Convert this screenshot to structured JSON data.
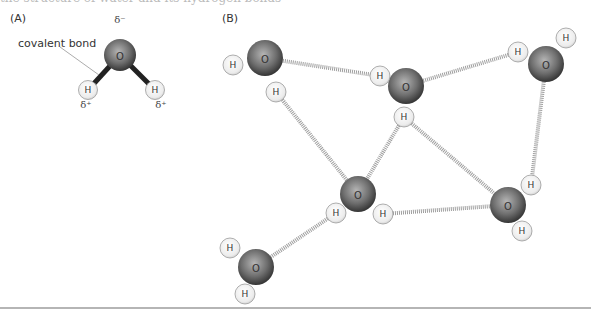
{
  "caption_fragment": "the structure of water and its hydrogen bonds",
  "panel_a": {
    "label": "(A)",
    "oxygen_symbol": "O",
    "hydrogen_symbol": "H",
    "partial_negative": "δ⁻",
    "partial_positive": "δ⁺",
    "bond_label": "covalent bond"
  },
  "panel_b": {
    "label": "(B)",
    "oxygen_symbol": "O",
    "hydrogen_symbol": "H",
    "molecule_count": 6,
    "hydrogen_bond_count": 8
  },
  "colors": {
    "oxygen_dark": "#3a3a3a",
    "oxygen_light": "#a8a8a8",
    "hydrogen_fill": "#eeeeee",
    "hydrogen_stroke": "#9a9a9a",
    "covalent_bond": "#222222",
    "hydrogen_bond": "#9e9e9e"
  }
}
